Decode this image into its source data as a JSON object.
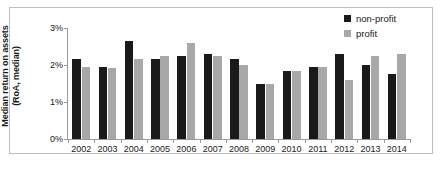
{
  "chart_data": {
    "type": "bar",
    "title": "",
    "xlabel": "",
    "ylabel": "Median return on assets (RoA, median)",
    "ylabel_line1": "Median return on assets",
    "ylabel_line2": "(RoA, median)",
    "ylim": [
      0,
      3
    ],
    "ytick_labels": [
      "0%",
      "1%",
      "2%",
      "3%"
    ],
    "ytick_values": [
      0,
      1,
      2,
      3
    ],
    "grid": false,
    "legend_position": "top-right",
    "categories": [
      "2002",
      "2003",
      "2004",
      "2005",
      "2006",
      "2007",
      "2008",
      "2009",
      "2010",
      "2011",
      "2012",
      "2013",
      "2014"
    ],
    "series": [
      {
        "name": "non-profit",
        "color": "#1a1a1a",
        "values": [
          2.15,
          1.95,
          2.65,
          2.15,
          2.25,
          2.3,
          2.15,
          1.5,
          1.85,
          1.95,
          2.3,
          2.0,
          1.75
        ]
      },
      {
        "name": "profit",
        "color": "#a8a8a8",
        "values": [
          1.95,
          1.92,
          2.15,
          2.25,
          2.6,
          2.25,
          2.0,
          1.5,
          1.85,
          1.95,
          1.6,
          2.25,
          2.3
        ]
      }
    ]
  },
  "legend": {
    "items": [
      {
        "label": "non-profit",
        "color": "#1a1a1a"
      },
      {
        "label": "profit",
        "color": "#a8a8a8"
      }
    ]
  }
}
